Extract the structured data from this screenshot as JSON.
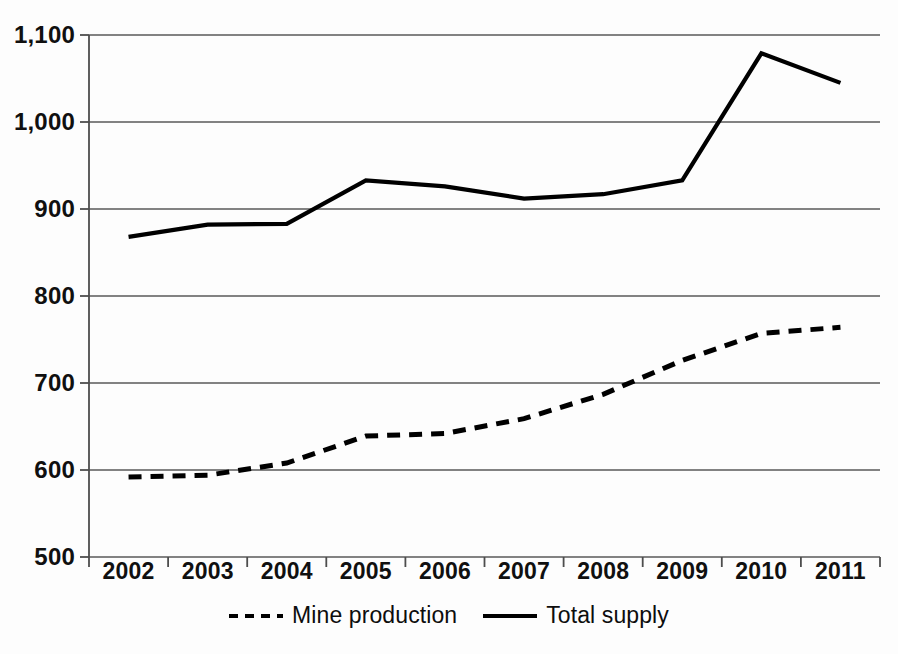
{
  "chart_data": {
    "type": "line",
    "title": "",
    "subtitle": "",
    "xlabel": "",
    "ylabel": "",
    "categories": [
      "2002",
      "2003",
      "2004",
      "2005",
      "2006",
      "2007",
      "2008",
      "2009",
      "2010",
      "2011"
    ],
    "series": [
      {
        "name": "Mine production",
        "style": "dashed",
        "color": "#000000",
        "values": [
          592,
          594,
          608,
          639,
          642,
          659,
          687,
          726,
          757,
          764
        ]
      },
      {
        "name": "Total supply",
        "style": "solid",
        "color": "#000000",
        "values": [
          868,
          882,
          883,
          933,
          926,
          912,
          917,
          933,
          1079,
          1045
        ]
      }
    ],
    "ylim": [
      500,
      1100
    ],
    "ytick_step": 100,
    "yticks": [
      {
        "value": 1100,
        "label": "1,100"
      },
      {
        "value": 1000,
        "label": "1,000"
      },
      {
        "value": 900,
        "label": "900"
      },
      {
        "value": 800,
        "label": "800"
      },
      {
        "value": 700,
        "label": "700"
      },
      {
        "value": 600,
        "label": "600"
      },
      {
        "value": 500,
        "label": "500"
      }
    ],
    "grid": {
      "horizontal": true,
      "vertical": false,
      "color": "#595959"
    },
    "legend": {
      "position": "bottom",
      "entries": [
        {
          "label": "Mine production",
          "style": "dashed"
        },
        {
          "label": "Total supply",
          "style": "solid"
        }
      ]
    },
    "axis": {
      "line_color": "#4d4d4d",
      "tick_marks": true
    },
    "plot_area": {
      "left": 89,
      "right": 880,
      "top": 35,
      "bottom": 557
    }
  }
}
